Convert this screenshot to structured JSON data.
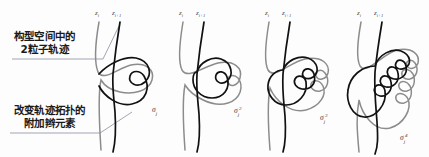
{
  "figure": {
    "title": "",
    "background_color": "#fdfdfd",
    "strand_dark_color": "#111111",
    "strand_grey_color": "#8c8c8c",
    "leader_color": "#7d7d94"
  },
  "annotations": [
    {
      "id": "trajectory-note",
      "line1": "构型空间中的",
      "line2": "2粒子轨迹"
    },
    {
      "id": "braid-element-note",
      "line1": "改变轨迹拓扑的",
      "line2": "附加辫元素"
    }
  ],
  "panels": [
    {
      "index": 1,
      "left_strand_label": "z",
      "left_strand_sub": "i",
      "right_strand_label": "z",
      "right_strand_sub": "i+1",
      "braid_symbol": "σ",
      "braid_sub": "j",
      "braid_sup": "",
      "loop_count": 1
    },
    {
      "index": 2,
      "left_strand_label": "z",
      "left_strand_sub": "i",
      "right_strand_label": "z",
      "right_strand_sub": "i+1",
      "braid_symbol": "σ",
      "braid_sub": "j",
      "braid_sup": "2",
      "loop_count": 2
    },
    {
      "index": 3,
      "left_strand_label": "z",
      "left_strand_sub": "i",
      "right_strand_label": "z",
      "right_strand_sub": "i+1",
      "braid_symbol": "σ",
      "braid_sub": "j",
      "braid_sup": "3",
      "loop_count": 3
    },
    {
      "index": 4,
      "left_strand_label": "z",
      "left_strand_sub": "i",
      "right_strand_label": "z",
      "right_strand_sub": "i+1",
      "braid_symbol": "σ",
      "braid_sub": "j",
      "braid_sup": "4",
      "loop_count": 4
    }
  ]
}
